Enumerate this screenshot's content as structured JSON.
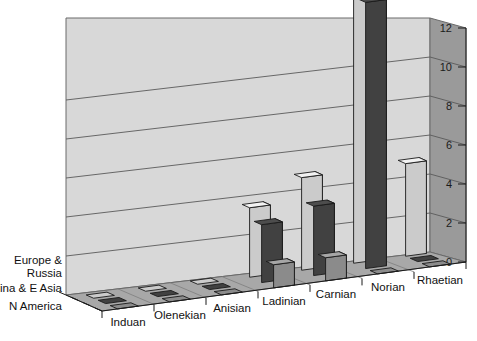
{
  "chart_data": {
    "type": "bar",
    "title": "",
    "subtitle": "",
    "xlabel": "",
    "ylabel": "",
    "zlabel": "",
    "projection": "3d-grouped-bar",
    "grid": true,
    "legend_position": "z-axis-left",
    "ylim": [
      0,
      12
    ],
    "yticks": [
      0,
      2,
      4,
      6,
      8,
      10,
      12
    ],
    "ytick_labels": [
      "0",
      "2",
      "4",
      "6",
      "8",
      "10",
      "12"
    ],
    "categories": [
      "Induan",
      "Olenekian",
      "Anisian",
      "Ladinian",
      "Carnian",
      "Norian",
      "Rhaetian"
    ],
    "series": [
      {
        "name": "Europe & Russia",
        "color": "#f2f2f2",
        "values": [
          0,
          0,
          0,
          3,
          4,
          12,
          4
        ]
      },
      {
        "name": "China & E Asia",
        "color": "#4d4d4d",
        "values": [
          0,
          0,
          0,
          2.5,
          3,
          11.5,
          0
        ]
      },
      {
        "name": "N America",
        "color": "#a6a6a6",
        "values": [
          0,
          0,
          0,
          1,
          1,
          0,
          0
        ]
      }
    ],
    "colors": {
      "back_wall": "#d8d8d8",
      "side_wall": "#9a9a9a",
      "floor": "#a8a8a8",
      "gridline": "#5a5a5a",
      "outline": "#1a1a1a",
      "background": "#ffffff"
    }
  }
}
